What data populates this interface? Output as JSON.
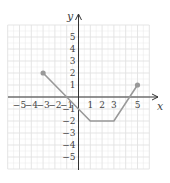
{
  "chart_data": {
    "type": "line",
    "title": "",
    "xlabel": "x",
    "ylabel": "y",
    "xlim": [
      -6,
      6
    ],
    "ylim": [
      -6,
      6
    ],
    "grid": true,
    "x_ticks": [
      "-5",
      "-4",
      "-3",
      "-2",
      "-1",
      "1",
      "2",
      "3",
      "5"
    ],
    "y_ticks": [
      "5",
      "4",
      "3",
      "2",
      "1",
      "-1",
      "-2",
      "-3",
      "-4",
      "-5"
    ],
    "series": [
      {
        "name": "f",
        "points": [
          [
            -3,
            2
          ],
          [
            1,
            -2
          ],
          [
            3,
            -2
          ],
          [
            5,
            1
          ]
        ],
        "endpoints_closed": true
      }
    ],
    "colors": {
      "line": "#999999",
      "axis": "#333333",
      "grid": "#e2e2e2",
      "point": "#999999"
    }
  }
}
